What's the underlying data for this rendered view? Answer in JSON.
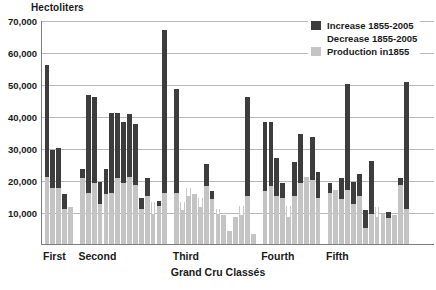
{
  "axes": {
    "y_unit_label": "Hectoliters",
    "y_ticks": [
      "70,000",
      "60,000",
      "50,000",
      "40,000",
      "30,000",
      "20,000",
      "10,000"
    ],
    "x_title": "Grand Cru Classés",
    "x_group_labels": [
      "First",
      "Second",
      "Third",
      "Fourth",
      "Fifth"
    ]
  },
  "legend": {
    "items": [
      {
        "label": "Increase 1855-2005",
        "swatch": "dark-gray-swatch-icon",
        "color": "#3d3d3d"
      },
      {
        "label": "Decrease 1855-2005",
        "swatch": "white-swatch-icon",
        "color": "#ffffff"
      },
      {
        "label": "Production in1855",
        "swatch": "light-gray-swatch-icon",
        "color": "#c4c4c4"
      }
    ]
  },
  "colors": {
    "increase": "#3d3d3d",
    "decrease": "#ffffff",
    "production_1855": "#c4c4c4",
    "gridline": "#b9b9b9",
    "axis": "#7d7d7d",
    "background": "#ffffff"
  },
  "chart_data": {
    "type": "bar",
    "title": "",
    "subtitle": "",
    "xlabel": "Grand Cru Classés",
    "ylabel": "Hectoliters",
    "ylim": [
      0,
      70000
    ],
    "ytick_values": [
      10000,
      20000,
      30000,
      40000,
      50000,
      60000,
      70000
    ],
    "grid": true,
    "legend_position": "top-right",
    "stacking": "production_1855 base, increase stacked above, decrease subtracted from top",
    "groups": [
      {
        "name": "First",
        "count": 5
      },
      {
        "name": "Second",
        "count": 15
      },
      {
        "name": "Third",
        "count": 14
      },
      {
        "name": "Fourth",
        "count": 10
      },
      {
        "name": "Fifth",
        "count": 18
      }
    ],
    "series": [
      {
        "name": "Production in1855",
        "color": "#c4c4c4",
        "values": [
          21000,
          17500,
          17500,
          11000,
          11500,
          20500,
          16000,
          19000,
          12500,
          15500,
          16000,
          20500,
          19000,
          21000,
          18500,
          11000,
          15000,
          13000,
          12000,
          16000,
          16000,
          13000,
          17500,
          15500,
          14500,
          18000,
          14000,
          11000,
          9000,
          4000,
          8500,
          12000,
          15000,
          3000,
          16500,
          18000,
          15000,
          14500,
          12000,
          15000,
          19000,
          21000,
          20000,
          14500,
          16000,
          17000,
          14000,
          17000,
          12500,
          15000,
          5000,
          9500,
          11500,
          9500,
          8000,
          9000,
          18500,
          11000
        ]
      },
      {
        "name": "Increase 1855-2005",
        "color": "#3d3d3d",
        "values": [
          35000,
          12000,
          12500,
          4500,
          0,
          3000,
          30500,
          27000,
          7000,
          8000,
          25000,
          20500,
          19000,
          19500,
          19000,
          3500,
          5500,
          0,
          1500,
          51000,
          32500,
          0,
          0,
          0,
          0,
          7000,
          2500,
          0,
          0,
          0,
          0,
          0,
          31000,
          0,
          21500,
          20000,
          12000,
          4500,
          0,
          10500,
          15500,
          0,
          13500,
          8000,
          3000,
          0,
          6500,
          33000,
          7000,
          7000,
          5500,
          16500,
          0,
          0,
          2000,
          0,
          2000,
          39500
        ]
      },
      {
        "name": "Decrease 1855-2005",
        "color": "#ffffff",
        "values": [
          0,
          0,
          0,
          0,
          0,
          0,
          0,
          0,
          0,
          0,
          0,
          0,
          0,
          0,
          0,
          0,
          0,
          3500,
          0,
          0,
          0,
          2500,
          2500,
          0,
          3000,
          0,
          0,
          1500,
          0,
          0,
          0,
          3000,
          0,
          0,
          0,
          0,
          0,
          0,
          3500,
          0,
          0,
          0,
          0,
          0,
          0,
          0,
          0,
          0,
          0,
          0,
          0,
          0,
          3000,
          0,
          0,
          0,
          0,
          0
        ]
      }
    ],
    "tallest_bar_value": 66500,
    "n_bars": 62
  }
}
